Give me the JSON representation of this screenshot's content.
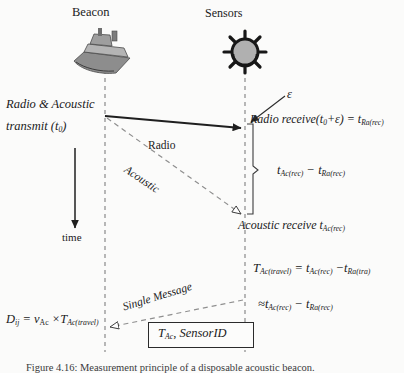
{
  "figure": {
    "beacon": {
      "caption": "Beacon",
      "icon": "ship-icon"
    },
    "sensors": {
      "caption": "Sensors",
      "icon": "sensor-buoy-icon"
    },
    "time_axis": {
      "label": "time"
    },
    "transmit": {
      "line1": "Radio & Acoustic",
      "line2_prefix": "transmit  (t",
      "line2_sub": "0",
      "line2_suffix": ")"
    },
    "paths": {
      "radio": "Radio",
      "acoustic": "Acoustic",
      "single_message": "Single Message"
    },
    "epsilon": "ε",
    "radio_receive": {
      "text_a": "Radio receive",
      "open_paren": "(t",
      "sub_zero": "0",
      "plus_eps": "+ε)",
      "equals": "=",
      "t": "t",
      "sub": "Ra(rec)"
    },
    "interval": {
      "t1": "t",
      "t1_sub": "Ac(rec)",
      "minus": "−",
      "t2": "t",
      "t2_sub": "Ra(rec)"
    },
    "acoustic_receive": {
      "text": "Acoustic receive",
      "t": "t",
      "sub": "Ac(rec)"
    },
    "travel_equation": {
      "T": "T",
      "T_sub": "Ac(travel)",
      "equals": "=",
      "t1": "t",
      "t1_sub": "Ac(rec)",
      "minus": "−",
      "t2": "t",
      "t2_sub": "Ra(tra)"
    },
    "approx_equation": {
      "approx": "≈",
      "t1": "t",
      "t1_sub": "Ac(rec)",
      "minus": "−",
      "t2": "t",
      "t2_sub": "Ra(rec)"
    },
    "distance_equation": {
      "D": "D",
      "D_sub": "ij",
      "equals": "=",
      "v": "v",
      "v_sub": "Ac",
      "times": "×",
      "T": "T",
      "T_sub": "Ac(travel)"
    },
    "message_box": {
      "T": "T",
      "T_sub": "Ac",
      "comma": ",",
      "sensor_id": "SensorID"
    },
    "caption": "Figure 4.16: Measurement principle of a disposable acoustic beacon.",
    "colors": {
      "ink": "#1a1a1a",
      "line": "#2b2b2b",
      "dashed": "#9a9a9a",
      "background": "#fbfbfa",
      "icon_fill": "#9b9b9b"
    }
  }
}
